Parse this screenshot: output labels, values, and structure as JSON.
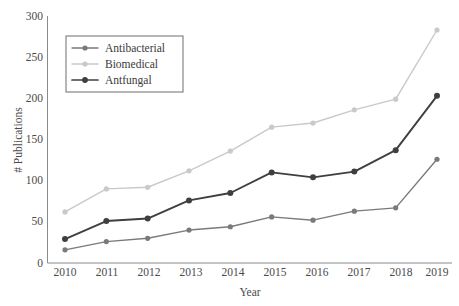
{
  "chart_data": {
    "type": "line",
    "title": "",
    "xlabel": "Year",
    "ylabel": "# Publications",
    "categories": [
      "2010",
      "2011",
      "2012",
      "2013",
      "2014",
      "2015",
      "2016",
      "2017",
      "2018",
      "2019"
    ],
    "x": [
      2010,
      2011,
      2012,
      2013,
      2014,
      2015,
      2016,
      2017,
      2018,
      2019
    ],
    "xlim": [
      2010,
      2019
    ],
    "ylim": [
      0,
      300
    ],
    "yticks": [
      0,
      50,
      100,
      150,
      200,
      250,
      300
    ],
    "xticks": [
      "2010",
      "2011",
      "2012",
      "2013",
      "2014",
      "2015",
      "2016",
      "2017",
      "2018",
      "2019"
    ],
    "grid": false,
    "legend_position": "upper-left",
    "series": [
      {
        "name": "Antibacterial",
        "color": "#7a7a7a",
        "marker": "circle",
        "values": [
          16,
          26,
          30,
          40,
          44,
          56,
          52,
          63,
          67,
          126
        ]
      },
      {
        "name": "Biomedical",
        "color": "#c9c9c9",
        "marker": "circle",
        "values": [
          62,
          90,
          92,
          112,
          136,
          165,
          170,
          186,
          199,
          283
        ]
      },
      {
        "name": "Antfungal",
        "color": "#3f3f3f",
        "marker": "circle",
        "values": [
          29,
          51,
          54,
          76,
          85,
          110,
          104,
          111,
          137,
          203
        ]
      }
    ]
  },
  "axes": {
    "y_title": "# Publications",
    "x_title": "Year",
    "y_tick_labels": [
      "300",
      "250",
      "200",
      "150",
      "100",
      "50",
      "0"
    ],
    "x_tick_labels": [
      "2010",
      "2011",
      "2012",
      "2013",
      "2014",
      "2015",
      "2016",
      "2017",
      "2018",
      "2019"
    ]
  },
  "legend": {
    "entries": [
      {
        "label": "Antibacterial",
        "color": "#7a7a7a"
      },
      {
        "label": "Biomedical",
        "color": "#c9c9c9"
      },
      {
        "label": "Antfungal",
        "color": "#3f3f3f"
      }
    ]
  }
}
